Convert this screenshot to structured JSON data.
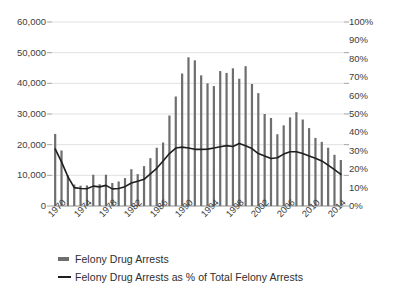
{
  "chart_data": {
    "type": "bar",
    "title": "",
    "subtitle": "",
    "xlabel": "",
    "ylabel": "",
    "y2label": "",
    "grid": true,
    "legend_position": "bottom-left",
    "x": [
      1970,
      1971,
      1972,
      1973,
      1974,
      1975,
      1976,
      1977,
      1978,
      1979,
      1980,
      1981,
      1982,
      1983,
      1984,
      1985,
      1986,
      1987,
      1988,
      1989,
      1990,
      1991,
      1992,
      1993,
      1994,
      1995,
      1996,
      1997,
      1998,
      1999,
      2000,
      2001,
      2002,
      2003,
      2004,
      2005,
      2006,
      2007,
      2008,
      2009,
      2010,
      2011,
      2012,
      2013,
      2014,
      2015
    ],
    "xtick_labels": [
      "1970",
      "1974",
      "1978",
      "1982",
      "1986",
      "1990",
      "1994",
      "1998",
      "2002",
      "2006",
      "2010",
      "2014"
    ],
    "xtick_values": [
      1970,
      1974,
      1978,
      1982,
      1986,
      1990,
      1994,
      1998,
      2002,
      2006,
      2010,
      2014
    ],
    "ylim": [
      0,
      60000
    ],
    "ytick_labels": [
      "0",
      "10,000",
      "20,000",
      "30,000",
      "40,000",
      "50,000",
      "60,000"
    ],
    "ytick_values": [
      0,
      10000,
      20000,
      30000,
      40000,
      50000,
      60000
    ],
    "y2lim": [
      0,
      100
    ],
    "y2tick_labels": [
      "0%",
      "10%",
      "20%",
      "30%",
      "40%",
      "50%",
      "60%",
      "70%",
      "80%",
      "90%",
      "100%"
    ],
    "y2tick_values": [
      0,
      10,
      20,
      30,
      40,
      50,
      60,
      70,
      80,
      90,
      100
    ],
    "series": [
      {
        "name": "Felony Drug Arrests",
        "type": "bar",
        "axis": "left",
        "color": "#6e6e6e",
        "values": [
          23500,
          18100,
          10000,
          7000,
          6600,
          6700,
          10200,
          7100,
          10200,
          7500,
          8000,
          9100,
          12000,
          10400,
          13000,
          15600,
          19000,
          20700,
          29500,
          35700,
          43200,
          48500,
          47500,
          42600,
          40000,
          39100,
          44000,
          43400,
          44900,
          41500,
          45600,
          39800,
          36800,
          30000,
          28700,
          23400,
          26300,
          28900,
          30600,
          28200,
          25400,
          22200,
          20900,
          19000,
          16700,
          15000
        ]
      },
      {
        "name": "Felony Drug Arrests as % of Total Felony Arrests",
        "type": "line",
        "axis": "right",
        "color": "#1f1f1f",
        "values": [
          31,
          24,
          16,
          10,
          9.5,
          9.4,
          10.8,
          10.4,
          11.2,
          9.3,
          9.5,
          10.5,
          12.5,
          13.5,
          14.5,
          17.5,
          20.5,
          24.5,
          28.5,
          31.5,
          32,
          31.5,
          30.8,
          30.8,
          30.9,
          31.5,
          32.2,
          32.8,
          32.3,
          34,
          32.8,
          31.2,
          28.5,
          27.2,
          25.8,
          26.2,
          28.2,
          29.5,
          29.5,
          28.5,
          27.2,
          26,
          24.5,
          22.2,
          19.8,
          17.2
        ]
      }
    ]
  },
  "legend": {
    "items": [
      {
        "label": "Felony Drug Arrests",
        "marker": "bar-swatch",
        "color": "#6e6e6e"
      },
      {
        "label": "Felony Drug Arrests as % of Total Felony Arrests",
        "marker": "line-swatch",
        "color": "#1f1f1f"
      }
    ]
  },
  "colors": {
    "bar": "#6e6e6e",
    "line": "#1f1f1f",
    "grid": "#d9d9d9",
    "axis": "#8c8c8c",
    "text": "#3d3d3d",
    "background": "#ffffff"
  }
}
